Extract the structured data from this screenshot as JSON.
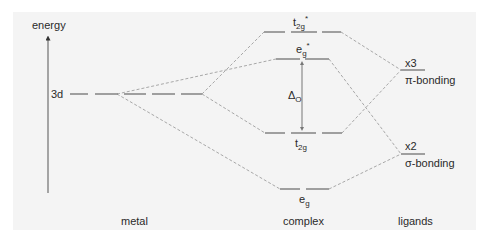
{
  "diagram": {
    "type": "molecular-orbital-energy-diagram",
    "axis": {
      "label": "energy",
      "arrow": "up"
    },
    "columns": {
      "metal": "metal",
      "complex": "complex",
      "ligands": "ligands"
    },
    "metal_levels": [
      {
        "id": "3d",
        "label": "3d",
        "degeneracy": 5
      }
    ],
    "complex_levels": [
      {
        "id": "t2g_star",
        "base": "t",
        "sub": "2g",
        "sup": "*",
        "degeneracy": 3
      },
      {
        "id": "eg_star",
        "base": "e",
        "sub": "g",
        "sup": "*",
        "degeneracy": 2
      },
      {
        "id": "t2g",
        "base": "t",
        "sub": "2g",
        "sup": "",
        "degeneracy": 3
      },
      {
        "id": "eg",
        "base": "e",
        "sub": "g",
        "sup": "",
        "degeneracy": 2
      }
    ],
    "ligand_levels": [
      {
        "id": "pi",
        "multiplicity": "x3",
        "label": "π-bonding"
      },
      {
        "id": "sigma",
        "multiplicity": "x2",
        "label": "σ-bonding"
      }
    ],
    "splitting": {
      "symbol": "Δ",
      "sub": "O",
      "between": [
        "eg_star",
        "t2g"
      ]
    },
    "connections": [
      {
        "from": "3d",
        "to": "t2g_star"
      },
      {
        "from": "3d",
        "to": "eg_star"
      },
      {
        "from": "3d",
        "to": "t2g"
      },
      {
        "from": "3d",
        "to": "eg"
      },
      {
        "from": "pi",
        "to": "t2g_star"
      },
      {
        "from": "pi",
        "to": "t2g"
      },
      {
        "from": "sigma",
        "to": "eg_star"
      },
      {
        "from": "sigma",
        "to": "eg"
      }
    ],
    "colors": {
      "background": "#f4f4f4",
      "level": "#8a8a8a",
      "connector": "#a6a6a6",
      "text": "#2a2a2a",
      "axis": "#555555"
    }
  }
}
